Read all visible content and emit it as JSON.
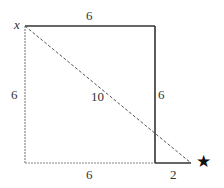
{
  "diagram": {
    "type": "geometry",
    "labels": {
      "corner": "x",
      "top_side": "6",
      "left_side": "6",
      "right_side": "6",
      "bottom_side": "6",
      "extension": "2",
      "diagonal": "10",
      "target": "★"
    },
    "colors": {
      "solid_line": "#333333",
      "dashed_line": "#555555",
      "dotted_edge": "#888888",
      "text": "#333333"
    }
  }
}
